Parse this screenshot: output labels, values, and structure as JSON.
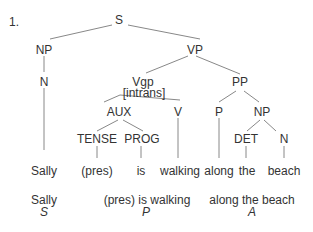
{
  "example_number": "1.",
  "tree": {
    "nodes": {
      "S": "S",
      "NP": "NP",
      "N": "N",
      "VP": "VP",
      "Vgp": "Vgp",
      "Vgp_feature": "[intrans]",
      "PP": "PP",
      "AUX": "AUX",
      "V": "V",
      "P": "P",
      "NP2": "NP",
      "TENSE": "TENSE",
      "PROG": "PROG",
      "DET": "DET",
      "N2": "N"
    },
    "leaves": {
      "sally": "Sally",
      "pres": "(pres)",
      "is": "is",
      "walking": "walking",
      "along": "along",
      "the": "the",
      "beach": "beach"
    }
  },
  "functions": [
    {
      "text": "Sally",
      "role": "S"
    },
    {
      "text": "(pres) is walking",
      "role": "P"
    },
    {
      "text": "along the beach",
      "role": "A"
    }
  ]
}
